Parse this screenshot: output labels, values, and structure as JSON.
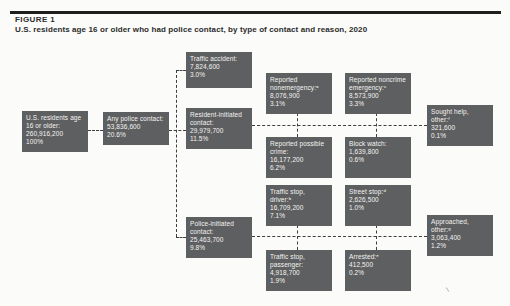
{
  "figure": {
    "label": "FIGURE 1",
    "title": "U.S. residents age 16 or older who had police contact, by type of contact and reason, 2020"
  },
  "colors": {
    "box": "#5e5f61",
    "box_text": "#f4f4f1",
    "connector": "#3e3e3e",
    "rule": "#1e1e1e",
    "background": "#fbfbf9",
    "heading": "#2b2b2b"
  },
  "nodes": {
    "us_residents": {
      "lines": [
        "U.S. residents age",
        "16 or older:",
        "260,916,200",
        "100%"
      ]
    },
    "any_contact": {
      "lines": [
        "Any police contact:",
        "53,836,600",
        "20.6%"
      ]
    },
    "traffic_accident": {
      "lines": [
        "Traffic accident:",
        "7,824,600",
        "3.0%"
      ]
    },
    "resident_initiated": {
      "lines": [
        "Resident-initiated",
        "contact:",
        "29,979,700",
        "11.5%"
      ]
    },
    "police_initiated": {
      "lines": [
        "Police-initiated",
        "contact:",
        "25,463,700",
        "9.8%"
      ]
    },
    "reported_nonemergency": {
      "lines": [
        "Reported",
        "nonemergency:ᵃ",
        "8,076,900",
        "3.1%"
      ]
    },
    "reported_noncrime_emergency": {
      "lines": [
        "Reported noncrime",
        "emergency:ᶜ",
        "8,573,900",
        "3.3%"
      ]
    },
    "sought_help_other": {
      "lines": [
        "Sought help,",
        "other:ᶠ",
        "321,600",
        "0.1%"
      ]
    },
    "reported_possible_crime": {
      "lines": [
        "Reported possible",
        "crime:",
        "16,177,200",
        "6.2%"
      ]
    },
    "block_watch": {
      "lines": [
        "Block watch:",
        "1,639,800",
        "0.6%"
      ]
    },
    "traffic_stop_driver": {
      "lines": [
        "Traffic stop,",
        "driver:ᵇ",
        "16,709,200",
        "7.1%"
      ]
    },
    "street_stop": {
      "lines": [
        "Street stop:ᵈ",
        "2,626,500",
        "1.0%"
      ]
    },
    "approached_other": {
      "lines": [
        "Approached,",
        "other:ᵍ",
        "3,063,400",
        "1.2%"
      ]
    },
    "traffic_stop_passenger": {
      "lines": [
        "Traffic stop,",
        "passenger:",
        "4,918,700",
        "1.9%"
      ]
    },
    "arrested": {
      "lines": [
        "Arrested:ᵉ",
        "412,500",
        "0.2%"
      ]
    }
  }
}
